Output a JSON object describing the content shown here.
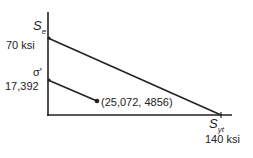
{
  "diagram": {
    "y_axis": {
      "upper_label_symbol": "S",
      "upper_label_sub": "e",
      "upper_value": "70 ksi",
      "lower_label_symbol": "σ′",
      "lower_value": "17,392"
    },
    "x_axis": {
      "label_symbol": "S",
      "label_sub": "yt",
      "value": "140 ksi"
    },
    "point_label": "(25,072, 4856)",
    "line_color": "#222222"
  }
}
